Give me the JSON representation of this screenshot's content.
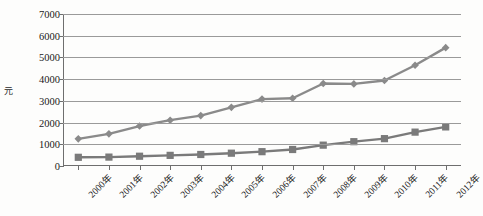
{
  "chart_data": {
    "type": "line",
    "title": "",
    "xlabel": "",
    "ylabel": "元",
    "ylim": [
      0,
      7000
    ],
    "ytick_values": [
      0,
      1000,
      2000,
      3000,
      4000,
      5000,
      6000,
      7000
    ],
    "ytick_labels": [
      "0",
      "1000",
      "2000",
      "3000",
      "4000",
      "5000",
      "6000",
      "7000"
    ],
    "grid": true,
    "legend_position": "none",
    "categories": [
      "2000年",
      "2001年",
      "2002年",
      "2003年",
      "2004年",
      "2005年",
      "2006年",
      "2007年",
      "2008年",
      "2009年",
      "2010年",
      "2011年",
      "2012年"
    ],
    "series": [
      {
        "name": "series-diamond",
        "marker": "diamond",
        "color": "#8a8a8a",
        "values": [
          1250,
          1480,
          1840,
          2110,
          2320,
          2700,
          3080,
          3120,
          3800,
          3780,
          3940,
          4640,
          5450
        ]
      },
      {
        "name": "series-square",
        "marker": "square",
        "color": "#7a7a7a",
        "values": [
          400,
          410,
          450,
          490,
          530,
          590,
          660,
          760,
          960,
          1120,
          1260,
          1560,
          1800
        ]
      }
    ]
  },
  "axis": {
    "y_axis_label": "元"
  }
}
